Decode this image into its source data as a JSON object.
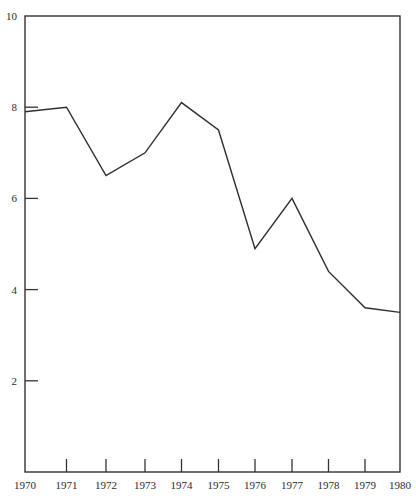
{
  "chart_data": {
    "type": "line",
    "title": "",
    "xlabel": "",
    "ylabel": "",
    "x": [
      1970,
      1971,
      1972,
      1973,
      1974,
      1975,
      1976,
      1977,
      1978,
      1979,
      1980
    ],
    "series": [
      {
        "name": "series-1",
        "values": [
          7.9,
          8.0,
          6.5,
          7.0,
          8.1,
          7.5,
          4.9,
          6.0,
          4.4,
          3.6,
          3.5
        ]
      }
    ],
    "x_tick_labels": [
      "1970",
      "1971",
      "1972",
      "1973",
      "1974",
      "1975",
      "1976",
      "1977",
      "1978",
      "1979",
      "1980"
    ],
    "y_tick_labels": [
      "2",
      "4",
      "6",
      "8",
      "10"
    ],
    "y_ticks": [
      2,
      4,
      6,
      8,
      10
    ],
    "xlim": [
      1970,
      1980
    ],
    "ylim": [
      0,
      10
    ],
    "grid": false,
    "legend": "none",
    "frame": "box",
    "colors": {
      "line": "#2e2e2e",
      "axes": "#333333",
      "text": "#2a2a2a",
      "background": "#ffffff"
    }
  }
}
